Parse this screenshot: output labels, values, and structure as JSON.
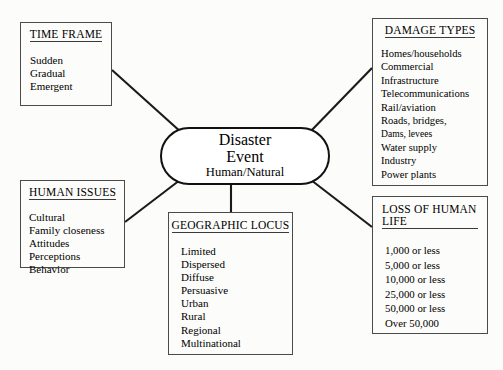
{
  "diagram": {
    "center": {
      "line1": "Disaster",
      "line2": "Event",
      "line3": "Human/Natural"
    },
    "boxes": {
      "time_frame": {
        "title": "TIME FRAME",
        "items": [
          "Sudden",
          "Gradual",
          "Emergent"
        ]
      },
      "damage_types": {
        "title": "DAMAGE TYPES",
        "items": [
          "Homes/households",
          "Commercial",
          "Infrastructure",
          "Telecommunications",
          "Rail/aviation",
          "Roads, bridges,",
          "Dams, levees",
          "Water supply",
          "Industry",
          "Power plants"
        ]
      },
      "human_issues": {
        "title": "HUMAN ISSUES",
        "items": [
          "Cultural",
          "Family closeness",
          "Attitudes",
          "Perceptions",
          "Behavior"
        ]
      },
      "geographic_locus": {
        "title": "GEOGRAPHIC LOCUS",
        "items": [
          "Limited",
          "Dispersed",
          "Diffuse",
          "Persuasive",
          "Urban",
          "Rural",
          "Regional",
          "Multinational"
        ]
      },
      "loss_of_life": {
        "title_line1": "LOSS OF HUMAN",
        "title_line2": "LIFE",
        "items": [
          "1,000 or less",
          "5,000 or less",
          "10,000 or less",
          "25,000 or less",
          "50,000 or less",
          "Over 50,000"
        ]
      }
    },
    "colors": {
      "line": "#1a1a1a",
      "box_border": "#4a4a4a",
      "background": "#fcfcfa"
    }
  }
}
